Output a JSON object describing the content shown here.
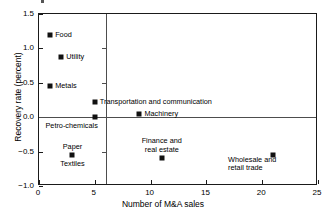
{
  "chart_data": {
    "type": "scatter",
    "title": "",
    "xlabel": "Number of M&A sales",
    "ylabel": "Recovery rate (percent)",
    "xlim": [
      0,
      25
    ],
    "ylim": [
      -1.0,
      1.5
    ],
    "xticks": [
      0,
      5,
      10,
      15,
      20,
      25
    ],
    "xticklabels": [
      "0",
      "5",
      "10",
      "15",
      "20",
      "25"
    ],
    "yticks": [
      -1.0,
      -0.5,
      0.0,
      0.5,
      1.0,
      1.5
    ],
    "yticklabels": [
      "-1.0",
      "-0.5",
      "0.0",
      "0.5",
      "1.0",
      "1.5"
    ],
    "grid": false,
    "legend": false,
    "reference_lines": {
      "horizontal": 0.0,
      "vertical": 6
    },
    "points": [
      {
        "label": "Food",
        "x": 1,
        "y": 1.2,
        "label_pos": "right"
      },
      {
        "label": "Utility",
        "x": 2,
        "y": 0.88,
        "label_pos": "right"
      },
      {
        "label": "Metals",
        "x": 1,
        "y": 0.45,
        "label_pos": "right"
      },
      {
        "label": "Transportation and communication",
        "x": 5,
        "y": 0.22,
        "label_pos": "right"
      },
      {
        "label": "Machinery",
        "x": 9,
        "y": 0.05,
        "label_pos": "right"
      },
      {
        "label": "Petro-chemicals",
        "x": 5,
        "y": 0.0,
        "label_pos": "below-left"
      },
      {
        "label": "Paper",
        "x": 3,
        "y": -0.55,
        "label_pos": "above-center"
      },
      {
        "label": "Textiles",
        "x": 3,
        "y": -0.55,
        "label_pos": "below-center"
      },
      {
        "label": "Finance and\nreal estate",
        "x": 11,
        "y": -0.6,
        "label_pos": "above-center"
      },
      {
        "label": "Wholesale and\nretail trade",
        "x": 21,
        "y": -0.55,
        "label_pos": "below-left"
      }
    ]
  }
}
